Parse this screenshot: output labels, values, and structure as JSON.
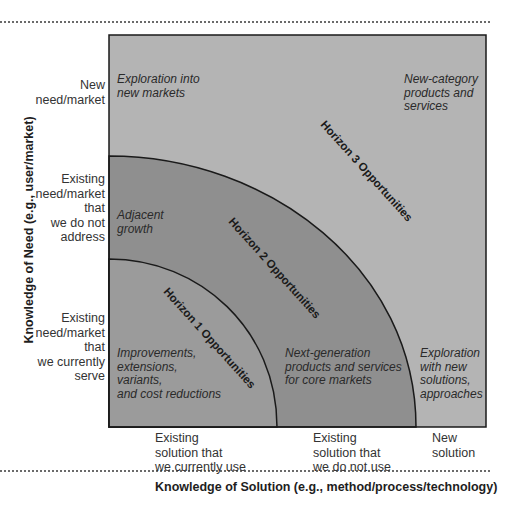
{
  "diagram": {
    "colors": {
      "horizon3_fill": "#b4b4b4",
      "horizon2_fill": "#8f8f8f",
      "horizon1_fill": "#a1a1a1",
      "outline": "#1a1a1a",
      "dotted_rule": "#6a6a6a"
    },
    "y_axis": {
      "title": "Knowledge of Need (e.g., user/market)",
      "levels": [
        {
          "label": "New need/market",
          "lines": [
            "New",
            "need/market"
          ]
        },
        {
          "label": "Existing need/market that we do not address",
          "lines": [
            "Existing",
            "need/market",
            "that",
            "we do not",
            "address"
          ]
        },
        {
          "label": "Existing need/market that we currently serve",
          "lines": [
            "Existing",
            "need/market",
            "that",
            "we currently",
            "serve"
          ]
        }
      ]
    },
    "x_axis": {
      "title": "Knowledge of Solution (e.g., method/process/technology)",
      "levels": [
        {
          "label": "Existing solution that we currently use",
          "lines": [
            "Existing",
            "solution that",
            "we currently use"
          ]
        },
        {
          "label": "Existing solution that we do not use",
          "lines": [
            "Existing",
            "solution that",
            "we do not use"
          ]
        },
        {
          "label": "New solution",
          "lines": [
            "New",
            "solution"
          ]
        }
      ]
    },
    "horizons": [
      {
        "name": "Horizon 1 Opportunities"
      },
      {
        "name": "Horizon 2 Opportunities"
      },
      {
        "name": "Horizon 3 Opportunities"
      }
    ],
    "zones": {
      "exploration_new_markets": [
        "Exploration into",
        "new markets"
      ],
      "new_category": [
        "New-category",
        "products and",
        "services"
      ],
      "adjacent_growth": [
        "Adjacent",
        "growth"
      ],
      "improvements": [
        "Improvements,",
        "extensions,",
        "variants,",
        "and cost reductions"
      ],
      "next_generation": [
        "Next-generation",
        "products and services",
        "for core markets"
      ],
      "exploration_new_solutions": [
        "Exploration",
        "with new",
        "solutions,",
        "approaches"
      ]
    }
  }
}
